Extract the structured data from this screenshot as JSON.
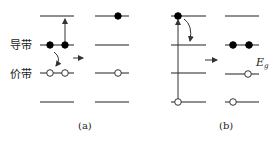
{
  "labels": {
    "conduction_band": "导带",
    "valence_band": "价带",
    "energy_gap": "E",
    "energy_gap_sub": "g",
    "panel_a_caption": "(a)",
    "panel_b_caption": "(b)"
  },
  "panels": [
    {
      "id": "a",
      "before": {
        "levels": 4,
        "electrons_on_level": [
          0,
          2,
          0,
          0
        ],
        "holes_on_level": [
          0,
          0,
          2,
          0
        ],
        "transitions": [
          "excitation-up-from-conduction-to-top",
          "relaxation-down-to-valence"
        ]
      },
      "after": {
        "electrons_on_level": [
          1,
          0,
          0,
          0
        ],
        "holes_on_level": [
          0,
          0,
          1,
          0
        ]
      }
    },
    {
      "id": "b",
      "before": {
        "levels": 4,
        "electrons_on_level": [
          1,
          0,
          0,
          0
        ],
        "holes_on_level": [
          0,
          0,
          0,
          1
        ],
        "transitions": [
          "excitation-up-from-bottom-to-top",
          "relaxation-down-to-conduction"
        ]
      },
      "after": {
        "electrons_on_level": [
          0,
          2,
          0,
          0
        ],
        "holes_on_level": [
          0,
          0,
          1,
          1
        ]
      }
    }
  ],
  "colors": {
    "level_line": "#6a6a6a",
    "electron": "#000000",
    "hole_fill": "#ffffff",
    "arrow": "#333333"
  }
}
